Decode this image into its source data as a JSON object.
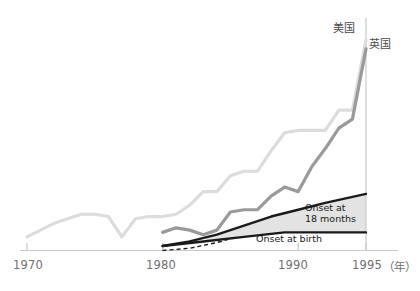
{
  "chart_data": {
    "type": "line",
    "title": "",
    "subtitle": "",
    "xlabel": "",
    "ylabel": "",
    "xlim": [
      1968.0,
      1996.5
    ],
    "ylim": [
      0,
      100
    ],
    "grid": false,
    "legend_position": "inline-right",
    "x_ticks": [
      1970,
      1980,
      1990,
      1995
    ],
    "x_tick_labels": [
      "1970",
      "1980",
      "1990",
      "1995"
    ],
    "x_axis_unit": "（年）",
    "y_axis_visible_right_at": 1995,
    "series": [
      {
        "name": "美国",
        "label_text": "美国",
        "color": "#dcdcdc",
        "style": "solid",
        "width": 3.2,
        "x": [
          1970,
          1971,
          1972,
          1973,
          1974,
          1975,
          1976,
          1977,
          1978,
          1979,
          1980,
          1981,
          1982,
          1983,
          1984,
          1985,
          1986,
          1987,
          1988,
          1989,
          1990,
          1991,
          1992,
          1993,
          1994,
          1995
        ],
        "y": [
          6,
          9,
          12,
          14,
          16,
          16,
          15,
          6,
          14,
          15,
          15,
          16,
          20,
          26,
          26,
          33,
          35,
          35,
          44,
          52,
          53,
          53,
          53,
          62,
          62,
          93
        ]
      },
      {
        "name": "英国",
        "label_text": "英国",
        "color": "#9a9a9a",
        "style": "solid",
        "width": 3.2,
        "x": [
          1980,
          1981,
          1982,
          1983,
          1984,
          1985,
          1986,
          1987,
          1988,
          1989,
          1990,
          1991,
          1992,
          1993,
          1994,
          1995
        ],
        "y": [
          8,
          10,
          9,
          7,
          9,
          17,
          18,
          18,
          24,
          28,
          26,
          37,
          45,
          54,
          58,
          89
        ]
      },
      {
        "name": "Onset at 18 months",
        "label_text": "Onset at\n18 months",
        "color": "#1a1a1a",
        "style": "solid",
        "width": 2.4,
        "x": [
          1980,
          1982,
          1984,
          1986,
          1988,
          1990,
          1992,
          1995
        ],
        "y": [
          2,
          4,
          7,
          11,
          15,
          18,
          21,
          25
        ]
      },
      {
        "name": "Onset at birth",
        "label_text": "Onset at birth",
        "color": "#1a1a1a",
        "style": "solid",
        "width": 2.4,
        "x": [
          1980,
          1983,
          1986,
          1989,
          1992,
          1995
        ],
        "y": [
          2,
          4,
          6,
          8,
          8,
          8
        ]
      },
      {
        "name": "dashed-lower",
        "label_text": "",
        "color": "#1a1a1a",
        "style": "dashed",
        "width": 1.4,
        "x": [
          1980,
          1982,
          1984,
          1985.5
        ],
        "y": [
          0,
          1,
          3.5,
          6
        ]
      }
    ],
    "shaded_band": {
      "between": [
        "Onset at birth",
        "Onset at 18 months"
      ],
      "fill": "#e3e3e3",
      "from_x": 1983.2,
      "to_x": 1995
    },
    "annotations": [
      {
        "text": "Onset at",
        "x": 1990.6,
        "y": 20.5
      },
      {
        "text": "18 months",
        "x": 1990.6,
        "y": 17.0
      },
      {
        "text": "Onset at birth",
        "x": 1989.0,
        "y": 4.0
      }
    ]
  },
  "axis": {
    "ticks": [
      {
        "label": "1970",
        "value": 1970
      },
      {
        "label": "1980",
        "value": 1980
      },
      {
        "label": "1990",
        "value": 1990
      },
      {
        "label": "1995",
        "value": 1995
      }
    ],
    "unit_label": "（年）"
  },
  "labels": {
    "us": "美国",
    "uk": "英国",
    "onset_18_line1": "Onset at",
    "onset_18_line2": "18 months",
    "onset_birth": "Onset at birth"
  },
  "colors": {
    "us_line": "#dcdcdc",
    "uk_line": "#9a9a9a",
    "onset_line": "#1a1a1a",
    "band_fill": "#e3e3e3",
    "axis": "#c9c9c9",
    "tick_text": "#6f6f6f",
    "background": "#ffffff"
  }
}
